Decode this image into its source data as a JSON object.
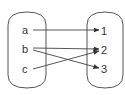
{
  "diagram": {
    "type": "mapping",
    "domain_set": {
      "elements": [
        {
          "label": "a",
          "x": 25,
          "y": 30
        },
        {
          "label": "b",
          "x": 25,
          "y": 49
        },
        {
          "label": "c",
          "x": 25,
          "y": 69
        }
      ]
    },
    "codomain_set": {
      "elements": [
        {
          "label": "1",
          "x": 104,
          "y": 31
        },
        {
          "label": "2",
          "x": 104,
          "y": 50
        },
        {
          "label": "3",
          "x": 104,
          "y": 69
        }
      ]
    },
    "mappings": [
      {
        "from": "a",
        "to": "1"
      },
      {
        "from": "b",
        "to": "2"
      },
      {
        "from": "b",
        "to": "3"
      },
      {
        "from": "c",
        "to": "2"
      }
    ],
    "colors": {
      "stroke": "#555555",
      "text": "#333333",
      "background": "#ffffff"
    }
  }
}
